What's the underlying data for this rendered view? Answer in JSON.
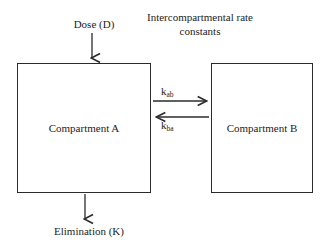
{
  "diagram": {
    "title_block": {
      "text": "Intercompartmental rate constants"
    },
    "input": {
      "label": "Dose (D)",
      "arrow": "down-arrow"
    },
    "output": {
      "label": "Elimination (K)",
      "arrow": "down-arrow"
    },
    "compartments": [
      {
        "id": "a",
        "label": "Compartment A"
      },
      {
        "id": "b",
        "label": "Compartment B"
      }
    ],
    "rate_constants": [
      {
        "id": "kab",
        "symbol": "k",
        "subscript": "ab",
        "direction": "right"
      },
      {
        "id": "kba",
        "symbol": "k",
        "subscript": "ba",
        "direction": "left"
      }
    ],
    "colors": {
      "background": "#ffffff",
      "stroke": "#2b2b2b",
      "text": "#232323"
    }
  }
}
